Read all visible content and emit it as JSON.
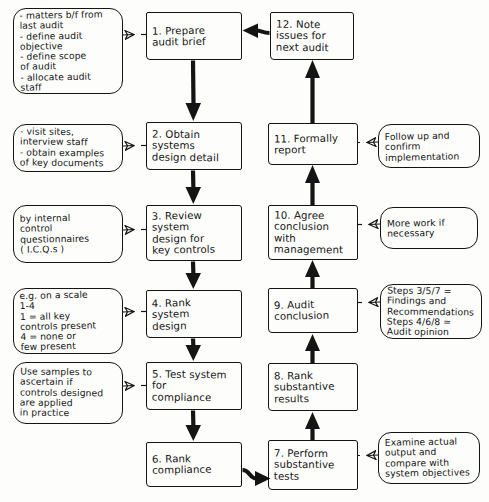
{
  "diagram": {
    "ink_color": "#141414",
    "background_color": "#fdfdfc"
  },
  "steps": [
    {
      "id": "step-1",
      "number": "1.",
      "label": "1. Prepare\naudit brief",
      "x": 146,
      "y": 12,
      "w": 96,
      "h": 48
    },
    {
      "id": "step-2",
      "number": "2.",
      "label": "2. Obtain\n   systems\ndesign detail",
      "x": 146,
      "y": 122,
      "w": 96,
      "h": 48
    },
    {
      "id": "step-3",
      "number": "3.",
      "label": "3. Review\n   system\n design for\nkey controls",
      "x": 146,
      "y": 205,
      "w": 96,
      "h": 56
    },
    {
      "id": "step-4",
      "number": "4.",
      "label": "4. Rank\n  system\n    design",
      "x": 146,
      "y": 290,
      "w": 96,
      "h": 48
    },
    {
      "id": "step-5",
      "number": "5.",
      "label": "5. Test system\n    for\n compliance",
      "x": 146,
      "y": 362,
      "w": 96,
      "h": 48
    },
    {
      "id": "step-6",
      "number": "6.",
      "label": "6. Rank\ncompliance",
      "x": 146,
      "y": 442,
      "w": 96,
      "h": 45
    },
    {
      "id": "step-7",
      "number": "7.",
      "label": "7. Perform\nsubstantive\n   tests",
      "x": 268,
      "y": 440,
      "w": 90,
      "h": 50
    },
    {
      "id": "step-8",
      "number": "8.",
      "label": "8. Rank\nsubstantive\n  results",
      "x": 268,
      "y": 363,
      "w": 90,
      "h": 48
    },
    {
      "id": "step-9",
      "number": "9.",
      "label": "9. Audit\nconclusion",
      "x": 268,
      "y": 288,
      "w": 90,
      "h": 45
    },
    {
      "id": "step-10",
      "number": "10.",
      "label": "10. Agree\nconclusion\n  with\nmanagement",
      "x": 268,
      "y": 205,
      "w": 90,
      "h": 55
    },
    {
      "id": "step-11",
      "number": "11.",
      "label": "11. Formally\n    report",
      "x": 268,
      "y": 123,
      "w": 90,
      "h": 42
    },
    {
      "id": "step-12",
      "number": "12.",
      "label": "12. Note\n  issues for\n next audit",
      "x": 270,
      "y": 12,
      "w": 84,
      "h": 48
    }
  ],
  "notes": [
    {
      "id": "note-brief",
      "label": "- matters b/f from\n  last audit\n- define audit\n  objective\n- define scope\n  of audit\n- allocate audit\n  staff",
      "attached_to": "step-1",
      "x": 13,
      "y": 8,
      "w": 110,
      "h": 86
    },
    {
      "id": "note-systems",
      "label": "- visit sites,\n  interview staff\n- obtain examples\n  of key documents",
      "attached_to": "step-2",
      "x": 13,
      "y": 124,
      "w": 110,
      "h": 48
    },
    {
      "id": "note-icq",
      "label": "by internal\ncontrol\nquestionnaires\n( I.C.Q.s )",
      "attached_to": "step-3",
      "x": 13,
      "y": 205,
      "w": 110,
      "h": 58
    },
    {
      "id": "note-scale",
      "label": "e.g. on a scale\n     1-4\n  1 = all key\ncontrols present\n  4 = none or\nfew present",
      "attached_to": "step-4",
      "x": 13,
      "y": 288,
      "w": 110,
      "h": 66
    },
    {
      "id": "note-samples",
      "label": "Use samples to\nascertain if\ncontrols designed\nare applied\nin practice",
      "attached_to": "step-5",
      "x": 13,
      "y": 362,
      "w": 110,
      "h": 62
    },
    {
      "id": "note-examine",
      "label": "Examine actual\noutput and\ncompare with\nsystem objectives",
      "attached_to": "step-7",
      "x": 378,
      "y": 432,
      "w": 102,
      "h": 52
    },
    {
      "id": "note-steps",
      "label": "Steps  3/5/7 =\nFindings and\nRecommendations\nSteps  4/6/8 =\nAudit opinion",
      "attached_to": "step-9",
      "x": 380,
      "y": 284,
      "w": 102,
      "h": 55
    },
    {
      "id": "note-morework",
      "label": "More work if\nnecessary",
      "attached_to": "step-10",
      "x": 380,
      "y": 207,
      "w": 98,
      "h": 42
    },
    {
      "id": "note-followup",
      "label": "Follow up and\nconfirm\nimplementation",
      "attached_to": "step-11",
      "x": 378,
      "y": 124,
      "w": 102,
      "h": 44
    }
  ],
  "connections": [
    {
      "id": "c1",
      "from": "step-1",
      "to": "step-2",
      "style": "thick-arrow",
      "direction": "down"
    },
    {
      "id": "c2",
      "from": "step-2",
      "to": "step-3",
      "style": "thick-arrow",
      "direction": "down"
    },
    {
      "id": "c3",
      "from": "step-3",
      "to": "step-4",
      "style": "thick-arrow",
      "direction": "down"
    },
    {
      "id": "c4",
      "from": "step-4",
      "to": "step-5",
      "style": "thick-arrow",
      "direction": "down"
    },
    {
      "id": "c5",
      "from": "step-5",
      "to": "step-6",
      "style": "thick-arrow",
      "direction": "down"
    },
    {
      "id": "c6",
      "from": "step-6",
      "to": "step-7",
      "style": "thick-arrow",
      "direction": "right"
    },
    {
      "id": "c7",
      "from": "step-7",
      "to": "step-8",
      "style": "thick-arrow",
      "direction": "up"
    },
    {
      "id": "c8",
      "from": "step-8",
      "to": "step-9",
      "style": "thick-arrow",
      "direction": "up"
    },
    {
      "id": "c9",
      "from": "step-9",
      "to": "step-10",
      "style": "thick-arrow",
      "direction": "up"
    },
    {
      "id": "c10",
      "from": "step-10",
      "to": "step-11",
      "style": "thick-arrow",
      "direction": "up"
    },
    {
      "id": "c11",
      "from": "step-11",
      "to": "step-12",
      "style": "thick-arrow",
      "direction": "up"
    },
    {
      "id": "c12",
      "from": "step-12",
      "to": "step-1",
      "style": "thick-arrow",
      "direction": "left"
    },
    {
      "id": "n1",
      "from": "note-brief",
      "to": "step-1",
      "style": "thin-open-arrow",
      "direction": "right"
    },
    {
      "id": "n2",
      "from": "note-systems",
      "to": "step-2",
      "style": "thin-open-arrow",
      "direction": "right"
    },
    {
      "id": "n3",
      "from": "note-icq",
      "to": "step-3",
      "style": "thin-open-arrow",
      "direction": "right"
    },
    {
      "id": "n4",
      "from": "note-scale",
      "to": "step-4",
      "style": "thin-open-arrow",
      "direction": "right"
    },
    {
      "id": "n5",
      "from": "note-samples",
      "to": "step-5",
      "style": "thin-open-arrow",
      "direction": "right"
    },
    {
      "id": "n6",
      "from": "note-examine",
      "to": "step-7",
      "style": "thin-open-arrow",
      "direction": "left"
    },
    {
      "id": "n7",
      "from": "note-steps",
      "to": "step-9",
      "style": "thin-open-arrow",
      "direction": "left"
    },
    {
      "id": "n8",
      "from": "note-morework",
      "to": "step-10",
      "style": "thin-open-arrow",
      "direction": "left"
    },
    {
      "id": "n9",
      "from": "note-followup",
      "to": "step-11",
      "style": "thin-open-arrow",
      "direction": "left"
    }
  ]
}
